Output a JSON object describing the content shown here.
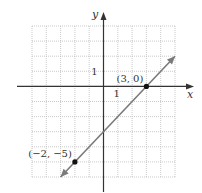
{
  "chart_data": {
    "type": "line",
    "title": "",
    "xlabel": "x",
    "ylabel": "y",
    "xlim": [
      -5,
      5
    ],
    "ylim": [
      -6,
      4
    ],
    "grid": true,
    "legend": null,
    "tick_labels": {
      "x": "1",
      "y": "1"
    },
    "series": [
      {
        "name": "line through (-2,-5) and (3,0)",
        "equation": "y = x - 3",
        "x": [
          -3,
          5
        ],
        "y": [
          -6,
          2
        ],
        "arrows": "both"
      }
    ],
    "points": [
      {
        "x": 3,
        "y": 0,
        "label": "(3, 0)"
      },
      {
        "x": -2,
        "y": -5,
        "label": "(−2, −5)"
      }
    ]
  },
  "colors": {
    "line": "#7a7a7a",
    "axis": "#333333",
    "grid": "#bdbdbd",
    "point": "#111111"
  }
}
